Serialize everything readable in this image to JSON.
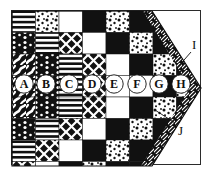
{
  "figure": {
    "shape": "arrow-pennant",
    "border_color": "#2b2b2b",
    "background": "#ffffff",
    "ink": "#111111"
  },
  "grid": {
    "cols": 8,
    "rows": 7,
    "cell_w": 23.5,
    "cell_h": 21.5,
    "origin_x": 12,
    "origin_y": 11,
    "pattern_names": [
      "solid-black",
      "solid-white",
      "horizontal-lines",
      "diagonal-lattice",
      "speckle-dots",
      "vertical-dots",
      "marble-swirl"
    ]
  },
  "cells": [
    {
      "r": 0,
      "c": 0,
      "p": "horizontal-lines"
    },
    {
      "r": 0,
      "c": 1,
      "p": "speckle-dots"
    },
    {
      "r": 0,
      "c": 2,
      "p": "solid-white"
    },
    {
      "r": 0,
      "c": 3,
      "p": "solid-black"
    },
    {
      "r": 0,
      "c": 4,
      "p": "speckle-dots"
    },
    {
      "r": 0,
      "c": 5,
      "p": "solid-black"
    },
    {
      "r": 0,
      "c": 6,
      "p": "solid-black"
    },
    {
      "r": 0,
      "c": 7,
      "p": "solid-black"
    },
    {
      "r": 1,
      "c": 0,
      "p": "vertical-dots"
    },
    {
      "r": 1,
      "c": 1,
      "p": "horizontal-lines"
    },
    {
      "r": 1,
      "c": 2,
      "p": "diagonal-lattice"
    },
    {
      "r": 1,
      "c": 3,
      "p": "solid-white"
    },
    {
      "r": 1,
      "c": 4,
      "p": "solid-black"
    },
    {
      "r": 1,
      "c": 5,
      "p": "speckle-dots"
    },
    {
      "r": 1,
      "c": 6,
      "p": "solid-black"
    },
    {
      "r": 1,
      "c": 7,
      "p": "solid-black"
    },
    {
      "r": 2,
      "c": 0,
      "p": "marble-swirl"
    },
    {
      "r": 2,
      "c": 1,
      "p": "vertical-dots"
    },
    {
      "r": 2,
      "c": 2,
      "p": "horizontal-lines"
    },
    {
      "r": 2,
      "c": 3,
      "p": "diagonal-lattice"
    },
    {
      "r": 2,
      "c": 4,
      "p": "solid-white"
    },
    {
      "r": 2,
      "c": 5,
      "p": "solid-black"
    },
    {
      "r": 2,
      "c": 6,
      "p": "speckle-dots"
    },
    {
      "r": 2,
      "c": 7,
      "p": "solid-black"
    },
    {
      "r": 3,
      "c": 0,
      "p": "marble-swirl"
    },
    {
      "r": 3,
      "c": 1,
      "p": "vertical-dots"
    },
    {
      "r": 3,
      "c": 2,
      "p": "horizontal-lines"
    },
    {
      "r": 3,
      "c": 3,
      "p": "diagonal-lattice"
    },
    {
      "r": 3,
      "c": 4,
      "p": "solid-white"
    },
    {
      "r": 3,
      "c": 5,
      "p": "solid-white"
    },
    {
      "r": 3,
      "c": 6,
      "p": "solid-black"
    },
    {
      "r": 3,
      "c": 7,
      "p": "speckle-dots"
    },
    {
      "r": 4,
      "c": 0,
      "p": "marble-swirl"
    },
    {
      "r": 4,
      "c": 1,
      "p": "vertical-dots"
    },
    {
      "r": 4,
      "c": 2,
      "p": "horizontal-lines"
    },
    {
      "r": 4,
      "c": 3,
      "p": "diagonal-lattice"
    },
    {
      "r": 4,
      "c": 4,
      "p": "solid-white"
    },
    {
      "r": 4,
      "c": 5,
      "p": "solid-black"
    },
    {
      "r": 4,
      "c": 6,
      "p": "speckle-dots"
    },
    {
      "r": 4,
      "c": 7,
      "p": "solid-black"
    },
    {
      "r": 5,
      "c": 0,
      "p": "vertical-dots"
    },
    {
      "r": 5,
      "c": 1,
      "p": "horizontal-lines"
    },
    {
      "r": 5,
      "c": 2,
      "p": "diagonal-lattice"
    },
    {
      "r": 5,
      "c": 3,
      "p": "solid-white"
    },
    {
      "r": 5,
      "c": 4,
      "p": "solid-black"
    },
    {
      "r": 5,
      "c": 5,
      "p": "speckle-dots"
    },
    {
      "r": 5,
      "c": 6,
      "p": "solid-black"
    },
    {
      "r": 5,
      "c": 7,
      "p": "solid-black"
    },
    {
      "r": 6,
      "c": 0,
      "p": "horizontal-lines"
    },
    {
      "r": 6,
      "c": 1,
      "p": "diagonal-lattice"
    },
    {
      "r": 6,
      "c": 2,
      "p": "solid-white"
    },
    {
      "r": 6,
      "c": 3,
      "p": "solid-black"
    },
    {
      "r": 6,
      "c": 4,
      "p": "speckle-dots"
    },
    {
      "r": 6,
      "c": 5,
      "p": "solid-black"
    },
    {
      "r": 6,
      "c": 6,
      "p": "solid-black"
    },
    {
      "r": 6,
      "c": 7,
      "p": "solid-black"
    },
    {
      "r": 7,
      "c": 0,
      "p": "diagonal-lattice"
    },
    {
      "r": 7,
      "c": 1,
      "p": "solid-white"
    },
    {
      "r": 7,
      "c": 2,
      "p": "solid-black"
    },
    {
      "r": 7,
      "c": 3,
      "p": "speckle-dots"
    },
    {
      "r": 7,
      "c": 4,
      "p": "solid-black"
    },
    {
      "r": 7,
      "c": 5,
      "p": "solid-black"
    },
    {
      "r": 7,
      "c": 6,
      "p": "solid-black"
    },
    {
      "r": 7,
      "c": 7,
      "p": "solid-black"
    }
  ],
  "callouts": {
    "circle_labels": [
      {
        "id": "A",
        "x": 24,
        "y": 84
      },
      {
        "id": "B",
        "x": 46,
        "y": 84
      },
      {
        "id": "C",
        "x": 69,
        "y": 84
      },
      {
        "id": "D",
        "x": 92,
        "y": 84
      },
      {
        "id": "E",
        "x": 114,
        "y": 84
      },
      {
        "id": "F",
        "x": 137,
        "y": 84
      },
      {
        "id": "G",
        "x": 159,
        "y": 84
      },
      {
        "id": "H",
        "x": 181,
        "y": 84
      }
    ],
    "leaders": [
      {
        "id": "I",
        "label": "I",
        "label_x": 192,
        "label_y": 38,
        "line_x1": 191,
        "line_y1": 52,
        "line_x2": 178,
        "line_y2": 67
      },
      {
        "id": "J",
        "label": "J",
        "label_x": 178,
        "label_y": 124,
        "line_x1": 175,
        "line_y1": 123,
        "line_x2": 155,
        "line_y2": 110
      }
    ]
  }
}
